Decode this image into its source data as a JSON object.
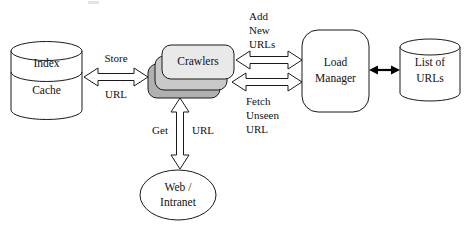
{
  "diagram": {
    "type": "flow-diagram",
    "background_color": "#ffffff",
    "stroke_color": "#1a1a1a",
    "nodes": {
      "index_cache": {
        "id": "index-cache-store",
        "shape": "cylinder",
        "label_top": "Index",
        "label_bottom": "Cache",
        "fill": "#ffffff"
      },
      "crawlers": {
        "id": "crawlers-stack",
        "shape": "stacked-rounded-rect",
        "label": "Crawlers",
        "stack_count": 3,
        "fill_front": "#e9e9e9",
        "fill_mid": "#c9c9c9",
        "fill_back": "#b0b0b0"
      },
      "load_manager": {
        "id": "load-manager",
        "shape": "rounded-rect",
        "label_line1": "Load",
        "label_line2": "Manager",
        "fill": "#ffffff"
      },
      "list_of_urls": {
        "id": "list-of-urls-store",
        "shape": "cylinder",
        "label_line1": "List of",
        "label_line2": "URLs",
        "fill": "#ffffff"
      },
      "web_intranet": {
        "id": "web-intranet",
        "shape": "ellipse",
        "label_line1": "Web /",
        "label_line2": "Intranet",
        "fill": "#ffffff"
      }
    },
    "edges": {
      "store_url": {
        "id": "crawlers-to-index-cache",
        "style": "hollow-block-double-arrow",
        "orientation": "horizontal",
        "label_line1": "Store",
        "label_line2": "URL"
      },
      "add_new_urls": {
        "id": "crawlers-to-load-manager-top",
        "style": "hollow-block-double-arrow",
        "orientation": "horizontal",
        "label_line1": "Add",
        "label_line2": "New",
        "label_line3": "URLs"
      },
      "fetch_unseen_url": {
        "id": "crawlers-to-load-manager-bottom",
        "style": "hollow-block-double-arrow",
        "orientation": "horizontal",
        "label_line1": "Fetch",
        "label_line2": "Unseen",
        "label_line3": "URL"
      },
      "get_url": {
        "id": "crawlers-to-web-intranet",
        "style": "hollow-block-double-arrow",
        "orientation": "vertical",
        "label_left": "Get",
        "label_right": "URL"
      },
      "manager_list": {
        "id": "load-manager-to-list-of-urls",
        "style": "thin-solid-double-arrow",
        "orientation": "horizontal",
        "label": ""
      }
    }
  }
}
